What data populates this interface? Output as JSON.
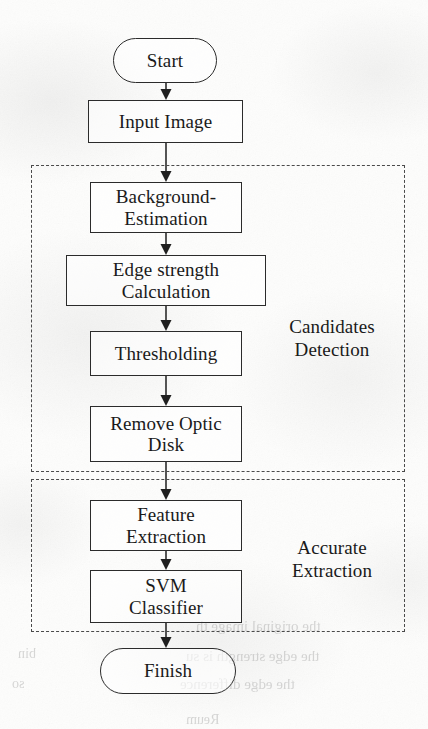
{
  "diagram": {
    "type": "flowchart",
    "orientation": "top-to-bottom",
    "colors": {
      "page_background": "#fdfdfc",
      "stroke": "#2b2b2b",
      "group_stroke": "#4a4a4a",
      "text": "#1a1a1a",
      "bleed_through": "#7d7d7d"
    },
    "nodes": [
      {
        "id": "start",
        "label": "Start",
        "shape": "terminal",
        "x": 113,
        "y": 38,
        "w": 104,
        "h": 45,
        "font_size": 19
      },
      {
        "id": "input",
        "label": "Input Image",
        "shape": "process",
        "x": 88,
        "y": 100,
        "w": 155,
        "h": 43,
        "font_size": 19
      },
      {
        "id": "background",
        "label": "Background-\nEstimation",
        "shape": "process",
        "x": 90,
        "y": 182,
        "w": 152,
        "h": 51,
        "font_size": 19
      },
      {
        "id": "edge",
        "label": "Edge strength\nCalculation",
        "shape": "process",
        "x": 66,
        "y": 255,
        "w": 200,
        "h": 51,
        "font_size": 19
      },
      {
        "id": "threshold",
        "label": "Thresholding",
        "shape": "process",
        "x": 90,
        "y": 331,
        "w": 152,
        "h": 45,
        "font_size": 19
      },
      {
        "id": "optic",
        "label": "Remove Optic\nDisk",
        "shape": "process",
        "x": 90,
        "y": 406,
        "w": 152,
        "h": 56,
        "font_size": 19
      },
      {
        "id": "feature",
        "label": "Feature\nExtraction",
        "shape": "process",
        "x": 90,
        "y": 500,
        "w": 152,
        "h": 51,
        "font_size": 19
      },
      {
        "id": "svm",
        "label": "SVM\nClassifier",
        "shape": "process",
        "x": 90,
        "y": 570,
        "w": 152,
        "h": 53,
        "font_size": 19
      },
      {
        "id": "finish",
        "label": "Finish",
        "shape": "terminal",
        "x": 100,
        "y": 648,
        "w": 136,
        "h": 46,
        "font_size": 19
      }
    ],
    "groups": [
      {
        "id": "candidates-detection",
        "label": "Candidates\nDetection",
        "x": 31,
        "y": 165,
        "w": 374,
        "h": 307,
        "label_x": 268,
        "label_y": 316,
        "label_w": 128,
        "font_size": 19
      },
      {
        "id": "accurate-extraction",
        "label": "Accurate\nExtraction",
        "x": 31,
        "y": 479,
        "w": 374,
        "h": 153,
        "label_x": 268,
        "label_y": 537,
        "label_w": 128,
        "font_size": 19
      }
    ],
    "connectors": [
      {
        "id": "start-to-input",
        "from": "start",
        "to": "input",
        "x": 166,
        "y1": 83,
        "y2": 100
      },
      {
        "id": "input-to-background",
        "from": "input",
        "to": "background",
        "x": 166,
        "y1": 143,
        "y2": 182
      },
      {
        "id": "background-to-edge",
        "from": "background",
        "to": "edge",
        "x": 166,
        "y1": 233,
        "y2": 255
      },
      {
        "id": "edge-to-threshold",
        "from": "edge",
        "to": "threshold",
        "x": 166,
        "y1": 306,
        "y2": 331
      },
      {
        "id": "threshold-to-optic",
        "from": "threshold",
        "to": "optic",
        "x": 166,
        "y1": 376,
        "y2": 406
      },
      {
        "id": "optic-to-feature",
        "from": "optic",
        "to": "feature",
        "x": 166,
        "y1": 462,
        "y2": 500
      },
      {
        "id": "feature-to-svm",
        "from": "feature",
        "to": "svm",
        "x": 166,
        "y1": 551,
        "y2": 570
      },
      {
        "id": "svm-to-finish",
        "from": "svm",
        "to": "finish",
        "x": 166,
        "y1": 623,
        "y2": 648
      }
    ],
    "bleed_through": [
      {
        "text": "the original image th",
        "x": 196,
        "y": 618,
        "size": 15
      },
      {
        "text": "the edge strength is su",
        "x": 186,
        "y": 648,
        "size": 15
      },
      {
        "text": "the edge difference",
        "x": 180,
        "y": 676,
        "size": 15
      },
      {
        "text": "Reum",
        "x": 186,
        "y": 712,
        "size": 14
      },
      {
        "text": "bin",
        "x": 18,
        "y": 646,
        "size": 14
      },
      {
        "text": "so",
        "x": 12,
        "y": 676,
        "size": 14
      }
    ]
  }
}
